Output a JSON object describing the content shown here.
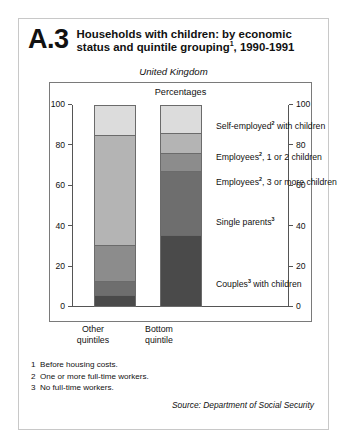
{
  "figure": {
    "number": "A.3",
    "title_line1": "Households with children: by economic",
    "title_line2_pre": "status and quintile grouping",
    "title_line2_sup": "1",
    "title_line2_post": ", 1990-1991",
    "subtitle": "United Kingdom",
    "unit_label": "Percentages"
  },
  "footnotes": [
    {
      "num": "1",
      "text": "Before housing costs."
    },
    {
      "num": "2",
      "text": "One or more full-time workers."
    },
    {
      "num": "3",
      "text": "No full-time workers."
    }
  ],
  "source": "Source: Department of Social Security",
  "axis": {
    "ticks": [
      "0",
      "20",
      "40",
      "60",
      "80",
      "100"
    ],
    "left_ticks": [
      "0",
      "20",
      "40",
      "60",
      "80",
      "100"
    ],
    "right_ticks": [
      "0",
      "20",
      "40",
      "60",
      "80",
      "100"
    ]
  },
  "legend_labels": {
    "self_employed_pre": "Self-employed",
    "self_employed_sup": "2",
    "self_employed_post": " with children",
    "employees_12_pre": "Employees",
    "employees_12_sup": "2",
    "employees_12_post": ", 1 or 2 children",
    "employees_3_pre": "Employees",
    "employees_3_sup": "2",
    "employees_3_post": ", 3 or more children",
    "single_parents_pre": "Single parents",
    "single_parents_sup": "3",
    "couples_pre": "Couples",
    "couples_sup": "3",
    "couples_post": " with children"
  },
  "chart_data": {
    "type": "bar",
    "subtype": "stacked-vertical-100",
    "subtitle": "United Kingdom",
    "xlabel": "",
    "ylabel": "Percentages",
    "ylim": [
      0,
      100
    ],
    "yticks": [
      0,
      20,
      40,
      60,
      80,
      100
    ],
    "grid": false,
    "dual_axis": true,
    "legend_position": "inline-right",
    "categories": [
      "Other quintiles",
      "Bottom quintile"
    ],
    "category_labels": [
      {
        "line1": "Other",
        "line2": "quintiles"
      },
      {
        "line1": "Bottom",
        "line2": "quintile"
      }
    ],
    "stack_order_bottom_up": [
      "Couples with children",
      "Single parents",
      "Employees, 3 or more children",
      "Employees, 1 or 2 children",
      "Self-employed with children"
    ],
    "series": [
      {
        "name": "Couples with children",
        "values": [
          5,
          35
        ],
        "color": "#4a4a4a"
      },
      {
        "name": "Single parents",
        "values": [
          7,
          32
        ],
        "color": "#6e6e6e"
      },
      {
        "name": "Employees, 3 or more children",
        "values": [
          18,
          9
        ],
        "color": "#8c8c8c"
      },
      {
        "name": "Employees, 1 or 2 children",
        "values": [
          55,
          10
        ],
        "color": "#b4b4b4"
      },
      {
        "name": "Self-employed with children",
        "values": [
          15,
          14
        ],
        "color": "#dcdcdc"
      }
    ],
    "cumulative_tops": {
      "Other quintiles": [
        5,
        12,
        30,
        85,
        100
      ],
      "Bottom quintile": [
        35,
        67,
        76,
        86,
        100
      ]
    }
  }
}
